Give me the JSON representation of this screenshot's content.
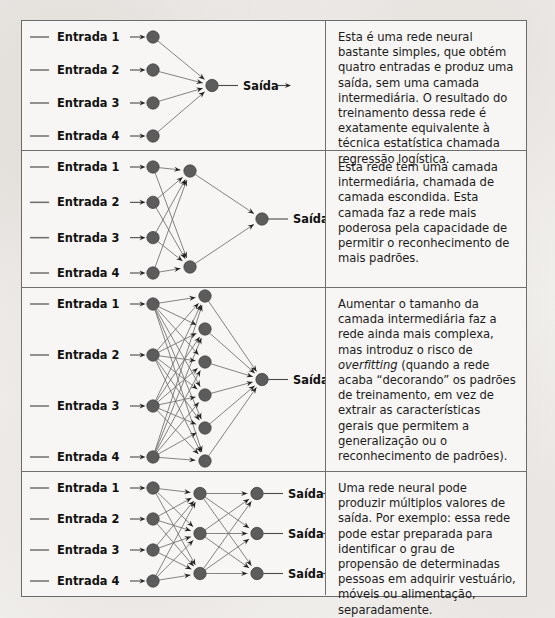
{
  "figure": {
    "background_color": "#f3f1ef",
    "panel_background": "#f7f6f4",
    "border_color": "#6b6b6b",
    "node_color": "#5c5c5c",
    "edge_color": "#6e6e6e"
  },
  "labels": {
    "input_prefix": "Entrada",
    "output": "Saída",
    "inputs": [
      "Entrada 1",
      "Entrada 2",
      "Entrada 3",
      "Entrada 4"
    ]
  },
  "panels": [
    {
      "id": "panel-1",
      "network": {
        "layers": [
          4,
          1
        ],
        "layer_names": [
          "input",
          "output"
        ],
        "hidden_layers": 0,
        "outputs": 1
      },
      "input_labels": [
        "Entrada 1",
        "Entrada 2",
        "Entrada 3",
        "Entrada 4"
      ],
      "output_labels": [
        "Saída"
      ],
      "caption": "Esta é uma rede neural bastante simples, que obtém quatro entradas e produz uma saída, sem uma camada intermediária. O resultado do treinamento dessa rede é exatamente equivalente à técnica estatística chamada regressão logística.",
      "caption_parts": [
        {
          "text": "Esta é uma rede neural bastante simples, que obtém quatro entradas e produz uma saída, sem uma camada intermediária. O resultado do treinamento dessa rede é exatamente equivalente à técnica estatística chamada regressão logística.",
          "italic": false
        }
      ]
    },
    {
      "id": "panel-2",
      "network": {
        "layers": [
          4,
          2,
          1
        ],
        "layer_names": [
          "input",
          "hidden",
          "output"
        ],
        "hidden_layers": 1,
        "outputs": 1
      },
      "input_labels": [
        "Entrada 1",
        "Entrada 2",
        "Entrada 3",
        "Entrada 4"
      ],
      "output_labels": [
        "Saída"
      ],
      "caption": "Esta rede tem uma camada intermediária, chamada de camada escondida. Esta camada faz a rede mais poderosa pela capacidade de permitir o reconhecimento de mais padrões.",
      "caption_parts": [
        {
          "text": "Esta rede tem uma camada intermediária, chamada de camada escondida. Esta camada faz a rede mais poderosa pela capacidade de permitir o reconhecimento de mais padrões.",
          "italic": false
        }
      ]
    },
    {
      "id": "panel-3",
      "network": {
        "layers": [
          4,
          6,
          1
        ],
        "layer_names": [
          "input",
          "hidden",
          "output"
        ],
        "hidden_layers": 1,
        "outputs": 1
      },
      "input_labels": [
        "Entrada 1",
        "Entrada 2",
        "Entrada 3",
        "Entrada 4"
      ],
      "output_labels": [
        "Saída"
      ],
      "caption": "Aumentar o tamanho da camada intermediária faz a rede ainda mais complexa, mas introduz o risco de overfitting (quando a rede acaba “decorando” os padrões de treinamento, em vez de extrair as características gerais que permitem a generalização ou o reconhecimento de padrões).",
      "caption_parts": [
        {
          "text": "Aumentar o tamanho da camada intermediária faz a rede ainda mais complexa, mas introduz o risco de ",
          "italic": false
        },
        {
          "text": "overfitting",
          "italic": true
        },
        {
          "text": " (quando a rede acaba “decorando” os padrões de treinamento, em vez de extrair as características gerais que permitem a generalização ou o reconhecimento de padrões).",
          "italic": false
        }
      ]
    },
    {
      "id": "panel-4",
      "network": {
        "layers": [
          4,
          3,
          3
        ],
        "layer_names": [
          "input",
          "hidden",
          "output"
        ],
        "hidden_layers": 1,
        "outputs": 3
      },
      "input_labels": [
        "Entrada 1",
        "Entrada 2",
        "Entrada 3",
        "Entrada 4"
      ],
      "output_labels": [
        "Saída",
        "Saída",
        "Saída"
      ],
      "caption": "Uma rede neural pode produzir múltiplos valores de saída. Por exemplo: essa rede pode estar preparada para identificar o grau de propensão de determinadas pessoas em adquirir vestuário, móveis ou alimentação, separadamente.",
      "caption_parts": [
        {
          "text": "Uma rede neural pode produzir múltiplos valores de saída. Por exemplo: essa rede pode estar preparada para identificar o grau de propensão de determinadas pessoas em adquirir vestuário, móveis ou alimentação, separadamente.",
          "italic": false
        }
      ]
    }
  ]
}
